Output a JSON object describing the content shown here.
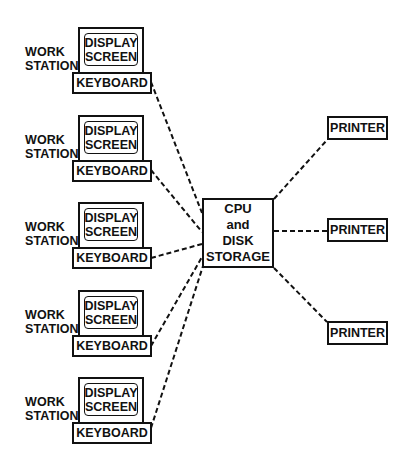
{
  "diagram": {
    "workstations": [
      {
        "label_line1": "WORK",
        "label_line2": "STATION",
        "screen_line1": "DISPLAY",
        "screen_line2": "SCREEN",
        "keyboard": "KEYBOARD"
      },
      {
        "label_line1": "WORK",
        "label_line2": "STATION",
        "screen_line1": "DISPLAY",
        "screen_line2": "SCREEN",
        "keyboard": "KEYBOARD"
      },
      {
        "label_line1": "WORK",
        "label_line2": "STATION",
        "screen_line1": "DISPLAY",
        "screen_line2": "SCREEN",
        "keyboard": "KEYBOARD"
      },
      {
        "label_line1": "WORK",
        "label_line2": "STATION",
        "screen_line1": "DISPLAY",
        "screen_line2": "SCREEN",
        "keyboard": "KEYBOARD"
      },
      {
        "label_line1": "WORK",
        "label_line2": "STATION",
        "screen_line1": "DISPLAY",
        "screen_line2": "SCREEN",
        "keyboard": "KEYBOARD"
      }
    ],
    "cpu": {
      "line1": "CPU",
      "line2": "and",
      "line3": "DISK",
      "line4": "STORAGE"
    },
    "printers": [
      {
        "label": "PRINTER"
      },
      {
        "label": "PRINTER"
      },
      {
        "label": "PRINTER"
      }
    ],
    "connections": [
      {
        "from": "workstation-1",
        "to": "cpu",
        "style": "dashed"
      },
      {
        "from": "workstation-2",
        "to": "cpu",
        "style": "dashed"
      },
      {
        "from": "workstation-3",
        "to": "cpu",
        "style": "dashed"
      },
      {
        "from": "workstation-4",
        "to": "cpu",
        "style": "dashed"
      },
      {
        "from": "workstation-5",
        "to": "cpu",
        "style": "dashed"
      },
      {
        "from": "cpu",
        "to": "printer-1",
        "style": "dashed"
      },
      {
        "from": "cpu",
        "to": "printer-2",
        "style": "dashed"
      },
      {
        "from": "cpu",
        "to": "printer-3",
        "style": "dashed"
      }
    ],
    "colors": {
      "ink": "#111111",
      "background": "#ffffff"
    }
  }
}
